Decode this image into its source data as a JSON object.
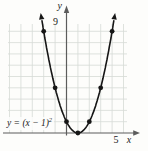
{
  "figure": {
    "y_axis_label": "y",
    "x_axis_label": "x",
    "y_tick_label": "9",
    "x_tick_label": "5",
    "equation_base": "y = (x − 1)",
    "equation_exponent": "2"
  },
  "chart_data": {
    "type": "line",
    "equation": "y = (x − 1)^2",
    "function": {
      "form": "a(x − h)^2 + k",
      "a": 1,
      "h": 1,
      "k": 0
    },
    "curve_x_range": [
      -2.15,
      4.15
    ],
    "marked_points": [
      [
        -2,
        9
      ],
      [
        -1,
        4
      ],
      [
        0,
        1
      ],
      [
        1,
        0
      ],
      [
        2,
        1
      ],
      [
        3,
        4
      ],
      [
        4,
        9
      ]
    ],
    "vertex": [
      1,
      0
    ],
    "xlabel": "x",
    "ylabel": "y",
    "xlim": [
      -5,
      5.5
    ],
    "ylim": [
      0,
      9.8
    ],
    "x_ticks_labeled": [
      5
    ],
    "y_ticks_labeled": [
      9
    ],
    "grid": true,
    "legend": "none",
    "colors": {
      "curve": "#161616",
      "grid": "#d6dbd6",
      "axis": "#5c5c5c",
      "background": "#fdfdfb",
      "text": "#1a1a1a"
    }
  }
}
